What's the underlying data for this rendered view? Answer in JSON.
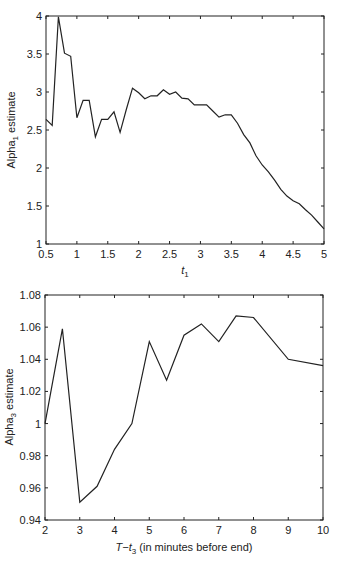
{
  "chart_data": [
    {
      "type": "line",
      "title": "",
      "xlabel": "t1",
      "xlabel_main": "t",
      "xlabel_sub": "1",
      "ylabel": "Alpha1 estimate",
      "ylabel_main": "Alpha",
      "ylabel_sub": "1",
      "ylabel_rest": " estimate",
      "xlim": [
        0.5,
        5
      ],
      "ylim": [
        1,
        4
      ],
      "grid": false,
      "legend": null,
      "xticks": [
        "0.5",
        "1",
        "1.5",
        "2",
        "2.5",
        "3",
        "3.5",
        "4",
        "4.5",
        "5"
      ],
      "yticks": [
        "1",
        "1.5",
        "2",
        "2.5",
        "3",
        "3.5",
        "4"
      ],
      "x": [
        0.5,
        0.6,
        0.7,
        0.8,
        0.9,
        1.0,
        1.1,
        1.2,
        1.3,
        1.4,
        1.5,
        1.6,
        1.7,
        1.8,
        1.9,
        2.0,
        2.1,
        2.2,
        2.3,
        2.4,
        2.5,
        2.6,
        2.7,
        2.8,
        2.9,
        3.0,
        3.1,
        3.2,
        3.3,
        3.4,
        3.5,
        3.6,
        3.7,
        3.8,
        3.9,
        4.0,
        4.1,
        4.2,
        4.3,
        4.4,
        4.5,
        4.6,
        4.7,
        4.8,
        4.9,
        5.0
      ],
      "values": [
        2.64,
        2.56,
        3.99,
        3.51,
        3.47,
        2.66,
        2.89,
        2.89,
        2.41,
        2.64,
        2.64,
        2.74,
        2.47,
        2.77,
        3.05,
        2.99,
        2.91,
        2.95,
        2.95,
        3.03,
        2.97,
        3.0,
        2.92,
        2.91,
        2.83,
        2.83,
        2.83,
        2.75,
        2.67,
        2.7,
        2.7,
        2.59,
        2.44,
        2.33,
        2.16,
        2.04,
        1.95,
        1.84,
        1.72,
        1.63,
        1.57,
        1.53,
        1.45,
        1.38,
        1.29,
        1.2
      ]
    },
    {
      "type": "line",
      "title": "",
      "xlabel": "T−t3 (in minutes before end)",
      "xlabel_main": "T−t",
      "xlabel_sub": "3",
      "xlabel_rest": " (in minutes before end)",
      "ylabel": "Alpha3 estimate",
      "ylabel_main": "Alpha",
      "ylabel_sub": "3",
      "ylabel_rest": " estimate",
      "xlim": [
        2,
        10
      ],
      "ylim": [
        0.94,
        1.08
      ],
      "grid": false,
      "legend": null,
      "xticks": [
        "2",
        "3",
        "4",
        "5",
        "6",
        "7",
        "8",
        "9",
        "10"
      ],
      "yticks": [
        "0.94",
        "0.96",
        "0.98",
        "1",
        "1.02",
        "1.04",
        "1.06",
        "1.08"
      ],
      "x": [
        2,
        2.5,
        3,
        3.5,
        4,
        4.5,
        5,
        5.5,
        6,
        6.5,
        7,
        7.5,
        8,
        9,
        10
      ],
      "values": [
        1.0,
        1.059,
        0.951,
        0.961,
        0.984,
        1.0,
        1.051,
        1.027,
        1.055,
        1.062,
        1.051,
        1.067,
        1.066,
        1.04,
        1.036
      ]
    }
  ]
}
